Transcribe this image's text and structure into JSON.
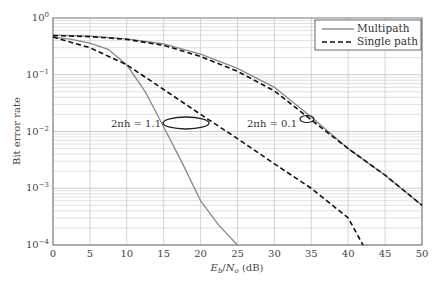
{
  "chart_data": {
    "type": "line",
    "title": "",
    "xlabel": "Eb/No (dB)",
    "ylabel": "Bit error rate",
    "xlim": [
      0,
      50
    ],
    "ylim": [
      0.0001,
      1
    ],
    "yscale": "log",
    "grid": true,
    "legend_position": "upper right",
    "x_ticks": [
      "0",
      "5",
      "10",
      "15",
      "20",
      "25",
      "30",
      "35",
      "40",
      "45",
      "50"
    ],
    "y_ticks": [
      "10^0",
      "10^-1",
      "10^-2",
      "10^-3",
      "10^-4"
    ],
    "legend": [
      {
        "label": "Multipath",
        "style": "solid",
        "color": "#888888"
      },
      {
        "label": "Single path",
        "style": "dashed",
        "color": "#111111"
      }
    ],
    "annotations": [
      {
        "text": "2πh = 1.1",
        "x": 18.5,
        "y": 0.015
      },
      {
        "text": "2πh = 0.1",
        "x": 35,
        "y": 0.018
      }
    ],
    "series": [
      {
        "name": "Multipath (2πh = 1.1)",
        "style": "solid",
        "x": [
          0,
          2.5,
          5,
          7.5,
          10,
          12.5,
          15,
          17.5,
          20,
          22.5,
          25
        ],
        "y": [
          0.46,
          0.42,
          0.36,
          0.28,
          0.15,
          0.05,
          0.012,
          0.0028,
          0.0006,
          0.00022,
          0.0001
        ]
      },
      {
        "name": "Single path (2πh = 1.1)",
        "style": "dashed",
        "x": [
          0,
          5,
          10,
          15,
          20,
          25,
          30,
          35,
          40,
          42
        ],
        "y": [
          0.46,
          0.3,
          0.15,
          0.055,
          0.02,
          0.0075,
          0.0027,
          0.001,
          0.0003,
          0.0001
        ]
      },
      {
        "name": "Multipath (2πh = 0.1)",
        "style": "solid",
        "x": [
          0,
          5,
          10,
          15,
          20,
          25,
          30,
          35,
          40,
          45,
          50
        ],
        "y": [
          0.5,
          0.48,
          0.43,
          0.35,
          0.23,
          0.13,
          0.06,
          0.018,
          0.005,
          0.0017,
          0.0005
        ]
      },
      {
        "name": "Single path (2πh = 0.1)",
        "style": "dashed",
        "x": [
          0,
          5,
          10,
          15,
          20,
          25,
          30,
          35,
          40,
          45,
          50
        ],
        "y": [
          0.49,
          0.47,
          0.42,
          0.33,
          0.21,
          0.115,
          0.052,
          0.016,
          0.005,
          0.0017,
          0.0005
        ]
      }
    ]
  },
  "labels": {
    "xlabel_eb": "E",
    "xlabel_b": "b",
    "xlabel_slash": "/",
    "xlabel_no": "N",
    "xlabel_o": "o",
    "xlabel_unit": " (dB)",
    "ylabel": "Bit error rate",
    "legend_multipath": "Multipath",
    "legend_single": "Single path",
    "ann_11": "2πh = 1.1",
    "ann_01": "2πh = 0.1",
    "ytick_base": "10",
    "ytick_exp": [
      "0",
      "−1",
      "−2",
      "−3",
      "−4"
    ]
  }
}
